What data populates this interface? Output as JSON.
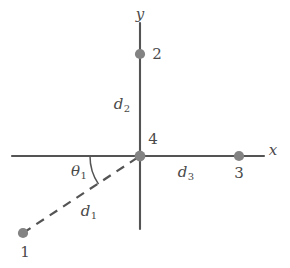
{
  "figure": {
    "type": "diagram",
    "background_color": "#ffffff",
    "ink_color": "#4a4a4a",
    "node_color": "#808080",
    "axes": {
      "x": {
        "label": "x",
        "start_px": [
          12,
          156
        ],
        "end_px": [
          264,
          156
        ]
      },
      "y": {
        "label": "y",
        "start_px": [
          140,
          23
        ],
        "end_px": [
          140,
          229
        ]
      },
      "origin_px": [
        140,
        156
      ]
    },
    "nodes": [
      {
        "id": "1",
        "label": "1",
        "x_px": 23,
        "y_px": 233,
        "label_x_px": 25,
        "label_y_px": 252,
        "style": "filled-circle"
      },
      {
        "id": "2",
        "label": "2",
        "x_px": 140,
        "y_px": 54,
        "label_x_px": 157,
        "label_y_px": 54,
        "style": "filled-circle"
      },
      {
        "id": "3",
        "label": "3",
        "x_px": 239,
        "y_px": 156,
        "label_x_px": 239,
        "label_y_px": 173,
        "style": "filled-circle"
      },
      {
        "id": "4",
        "label": "4",
        "x_px": 140,
        "y_px": 156,
        "label_x_px": 153,
        "label_y_px": 139,
        "style": "filled-circle"
      }
    ],
    "segments": [
      {
        "name": "d1",
        "label": "d",
        "sub": "1",
        "from": "1",
        "to": "4",
        "style": "dashed",
        "label_x_px": 89,
        "label_y_px": 212
      },
      {
        "name": "d2",
        "label": "d",
        "sub": "2",
        "from": "2",
        "to": "4",
        "style": "solid-axis",
        "label_x_px": 122,
        "label_y_px": 105
      },
      {
        "name": "d3",
        "label": "d",
        "sub": "3",
        "from": "4",
        "to": "3",
        "style": "solid-axis",
        "label_x_px": 186,
        "label_y_px": 173
      }
    ],
    "angle": {
      "name": "theta1",
      "label": "θ",
      "sub": "1",
      "vertex": "4",
      "from_ray": "negative-x-axis",
      "to_ray": "d1",
      "label_x_px": 79,
      "label_y_px": 172,
      "arc_radius_px": 50
    }
  }
}
